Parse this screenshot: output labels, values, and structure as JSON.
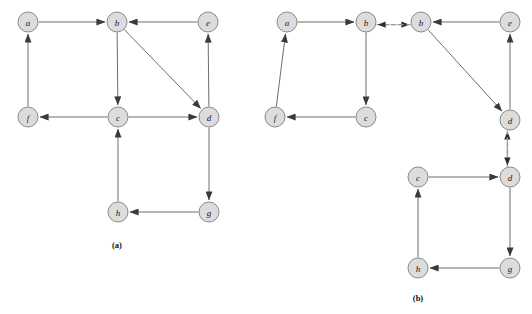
{
  "figure": {
    "width": 532,
    "height": 314,
    "background_color": "#ffffff",
    "node_fill_color": "#dcdcdc",
    "node_stroke_color": "#8a8a8a",
    "edge_color": "#6e6e6e",
    "dashed_edge_color": "#9a9a9a",
    "node_radius": 10
  },
  "panels": [
    {
      "id": "panel-a",
      "caption": "(a)",
      "caption_x": 117,
      "caption_y": 248,
      "nodes": [
        {
          "id": "a-a",
          "label": "a",
          "x": 28,
          "y": 22
        },
        {
          "id": "a-b",
          "label": "b",
          "x": 117,
          "y": 22
        },
        {
          "id": "a-e",
          "label": "e",
          "x": 208,
          "y": 22
        },
        {
          "id": "a-f",
          "label": "f",
          "x": 28,
          "y": 117
        },
        {
          "id": "a-c",
          "label": "c",
          "x": 118,
          "y": 117
        },
        {
          "id": "a-d",
          "label": "d",
          "x": 209,
          "y": 117
        },
        {
          "id": "a-h",
          "label": "h",
          "x": 118,
          "y": 212
        },
        {
          "id": "a-g",
          "label": "g",
          "x": 209,
          "y": 212
        }
      ],
      "edges": [
        {
          "from": "a-a",
          "to": "a-b",
          "style": "solid",
          "name": "edge-a-to-b"
        },
        {
          "from": "a-e",
          "to": "a-b",
          "style": "solid",
          "name": "edge-e-to-b"
        },
        {
          "from": "a-b",
          "to": "a-c",
          "style": "solid",
          "name": "edge-b-to-c"
        },
        {
          "from": "a-b",
          "to": "a-d",
          "style": "solid",
          "name": "edge-b-to-d"
        },
        {
          "from": "a-c",
          "to": "a-f",
          "style": "solid",
          "name": "edge-c-to-f"
        },
        {
          "from": "a-c",
          "to": "a-d",
          "style": "solid",
          "name": "edge-c-to-d"
        },
        {
          "from": "a-f",
          "to": "a-a",
          "style": "solid",
          "name": "edge-f-to-a"
        },
        {
          "from": "a-d",
          "to": "a-e",
          "style": "solid",
          "name": "edge-d-to-e"
        },
        {
          "from": "a-d",
          "to": "a-g",
          "style": "solid",
          "name": "edge-d-to-g"
        },
        {
          "from": "a-g",
          "to": "a-h",
          "style": "solid",
          "name": "edge-g-to-h"
        },
        {
          "from": "a-h",
          "to": "a-c",
          "style": "solid",
          "name": "edge-h-to-c"
        }
      ]
    },
    {
      "id": "panel-b",
      "caption": "(b)",
      "caption_x": 418,
      "caption_y": 301,
      "nodes": [
        {
          "id": "b-a",
          "label": "a",
          "x": 287,
          "y": 22
        },
        {
          "id": "b-b1",
          "label": "b",
          "x": 366,
          "y": 22
        },
        {
          "id": "b-b2",
          "label": "b",
          "x": 421,
          "y": 22
        },
        {
          "id": "b-e",
          "label": "e",
          "x": 510,
          "y": 22
        },
        {
          "id": "b-f",
          "label": "f",
          "x": 275,
          "y": 117
        },
        {
          "id": "b-c1",
          "label": "c",
          "x": 366,
          "y": 117
        },
        {
          "id": "b-d1",
          "label": "d",
          "x": 510,
          "y": 120
        },
        {
          "id": "b-c2",
          "label": "c",
          "x": 418,
          "y": 177
        },
        {
          "id": "b-d2",
          "label": "d",
          "x": 510,
          "y": 177
        },
        {
          "id": "b-h",
          "label": "h",
          "x": 418,
          "y": 268
        },
        {
          "id": "b-g",
          "label": "g",
          "x": 510,
          "y": 268
        }
      ],
      "edges": [
        {
          "from": "b-a",
          "to": "b-b1",
          "style": "solid",
          "name": "edge-a-to-b1"
        },
        {
          "from": "b-b1",
          "to": "b-b2",
          "style": "dashed",
          "name": "edge-b1-to-b2-dashed"
        },
        {
          "from": "b-b2",
          "to": "b-b1",
          "style": "dashed",
          "name": "edge-b2-to-b1-dashed"
        },
        {
          "from": "b-e",
          "to": "b-b2",
          "style": "solid",
          "name": "edge-e-to-b2"
        },
        {
          "from": "b-b1",
          "to": "b-c1",
          "style": "solid",
          "name": "edge-b1-to-c1"
        },
        {
          "from": "b-b2",
          "to": "b-d1",
          "style": "solid",
          "name": "edge-b2-to-d1"
        },
        {
          "from": "b-c1",
          "to": "b-f",
          "style": "solid",
          "name": "edge-c1-to-f"
        },
        {
          "from": "b-f",
          "to": "b-a",
          "style": "solid",
          "name": "edge-f-to-a"
        },
        {
          "from": "b-d1",
          "to": "b-e",
          "style": "solid",
          "name": "edge-d1-to-e"
        },
        {
          "from": "b-d2",
          "to": "b-d1",
          "style": "dashed",
          "name": "edge-d2-to-d1-dashed"
        },
        {
          "from": "b-d1",
          "to": "b-d2",
          "style": "dashed",
          "name": "edge-d1-to-d2-dashed"
        },
        {
          "from": "b-c2",
          "to": "b-d2",
          "style": "solid",
          "name": "edge-c2-to-d2"
        },
        {
          "from": "b-d2",
          "to": "b-g",
          "style": "solid",
          "name": "edge-d2-to-g"
        },
        {
          "from": "b-g",
          "to": "b-h",
          "style": "solid",
          "name": "edge-g-to-h"
        },
        {
          "from": "b-h",
          "to": "b-c2",
          "style": "solid",
          "name": "edge-h-to-c2"
        }
      ]
    }
  ]
}
